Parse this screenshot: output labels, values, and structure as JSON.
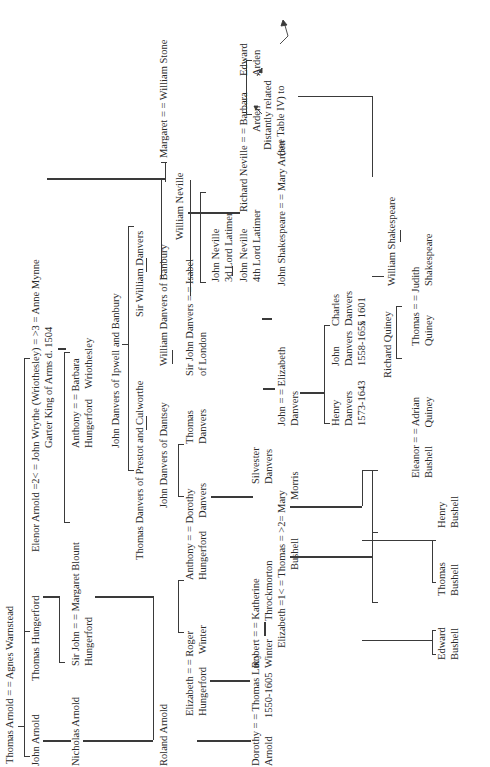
{
  "diagram": {
    "type": "genealogy-table",
    "orientation": "rotated-90-ccw",
    "line_color": "#3a3a3a",
    "text_color": "#2a2a2a",
    "nodes": {
      "thomas_arnold": "Thomas Arnold = = Agnes Warnstead",
      "john_arnold": "John Arnold",
      "thomas_hungerford": "Thomas Hungerford",
      "elenor_arnold": "Elenor Arnold =2< = John Wrythe (Wriothesley) = >3 = Anne Mynne",
      "garter_king": "Garter King of Arms d. 1504",
      "nicholas_arnold": "Nicholas Arnold",
      "sir_john_hungerford_1": "Sir John = = Margaret Blount",
      "sir_john_hungerford_2": "Hungerford",
      "anthony_barbara_1": "Anthony = = Barbara",
      "anthony_barbara_2": "Hungerford    Wriothesley",
      "john_danvers_ipwell": "John Danvers of Ipwell and Banbury",
      "thomas_danvers_prestot": "Thomas Danvers of Prestot and Culworthe",
      "sir_william_danvers": "Sir William Danvers",
      "john_danvers_dantsey": "John Danvers of Dantsey",
      "william_danvers_banbury": "William Danvers of Banbury",
      "margaret_stone": "Margaret = = William Stone",
      "roland_arnold": "Roland Arnold",
      "elizabeth_roger_1": "Elizabeth = = Roger",
      "elizabeth_roger_2": "Hungerford     Winter",
      "anthony_dorothy_1": "Anthony = = Dorothy",
      "anthony_dorothy_2": "Hungerford     Danvers",
      "thomas_danvers_1": "Thomas",
      "thomas_danvers_2": "Danvers",
      "sir_john_isabel_1": "Sir John Danvers = = Isabel",
      "sir_john_isabel_2": "of London",
      "william_neville": "William Neville",
      "john_neville_3_1": "John Neville",
      "john_neville_3_2": "3d Lord Latimer",
      "john_neville_4_1": "John Neville",
      "john_neville_4_2": "4th Lord Latimer",
      "richard_barbara": "Richard Neville = = Barbara",
      "barbara_arden": "Arden",
      "edward_arden_1": "Edward",
      "edward_arden_2": "Arden",
      "distantly_1": "Distantly related",
      "distantly_2": "(see Table IV) to",
      "dorothy_lucy_1": "Dorothy = = Thomas Lucy",
      "dorothy_lucy_2": "Arnold       1550-1605",
      "robert_katherine_1": "Robert = = Katherine",
      "robert_katherine_2": "Winter       Throckmorton",
      "silvester_1": "Silvester",
      "silvester_2": "Danvers",
      "john_elizabeth_1": "John = = Elizabeth",
      "john_elizabeth_2": "Danvers",
      "henry_danvers_1": "Henry",
      "henry_danvers_2": "Danvers",
      "henry_danvers_3": "1573-1643",
      "john_danvers_1": "John",
      "john_danvers_2": "Danvers",
      "john_danvers_3": "1558-1655",
      "charles_danvers_1": "Charles",
      "charles_danvers_2": "Danvers",
      "charles_danvers_3": "x 1601",
      "john_shakespeare": "John Shakespeare = = Mary Arden",
      "elizabeth_thomas_1": "Elizabeth =1< = Thomas = >2= Mary",
      "elizabeth_thomas_2": "Bushell",
      "mary_morris": "Morris",
      "richard_quiney": "Richard Quiney",
      "william_shakespeare": "William Shakespeare",
      "eleanor_adrian_1": "Eleanor = = Adrian",
      "eleanor_adrian_2": "Bushell       Quiney",
      "thomas_judith_1": "Thomas = = Judith",
      "thomas_judith_2": "Quiney",
      "judith_shakespeare": "Shakespeare",
      "henry_bushell_1": "Henry",
      "henry_bushell_2": "Bushell",
      "thomas_bushell_1": "Thomas",
      "thomas_bushell_2": "Bushell",
      "edward_bushell_1": "Edward",
      "edward_bushell_2": "Bushell"
    }
  }
}
